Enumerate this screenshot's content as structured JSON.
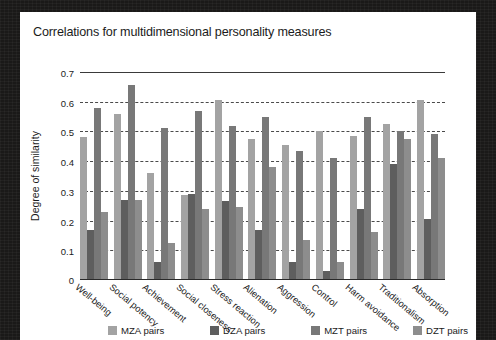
{
  "card": {
    "background": "#ffffff",
    "frame_color": "#1a1918"
  },
  "chart_data": {
    "type": "bar",
    "title": "Correlations for multidimensional personality measures",
    "xlabel": "",
    "ylabel": "Degree of similarity",
    "ylim": [
      0,
      0.7
    ],
    "yticks": [
      "0",
      "0.1",
      "0.2",
      "0.3",
      "0.4",
      "0.5",
      "0.6",
      "0.7"
    ],
    "ytick_values": [
      0,
      0.1,
      0.2,
      0.3,
      0.4,
      0.5,
      0.6,
      0.7
    ],
    "grid": true,
    "grid_style": "dashed-horizontal",
    "legend_position": "bottom",
    "categories": [
      "Well-being",
      "Social potency",
      "Achievement",
      "Social closeness",
      "Stress reaction",
      "Alienation",
      "Aggression",
      "Control",
      "Harm avoidance",
      "Traditionalism",
      "Absorption"
    ],
    "series": [
      {
        "name": "MZA pairs",
        "color": "#a3a3a3",
        "values": [
          0.48,
          0.56,
          0.36,
          0.285,
          0.605,
          0.475,
          0.455,
          0.5,
          0.485,
          0.525,
          0.605
        ]
      },
      {
        "name": "DZA pairs",
        "color": "#5e5e5e",
        "values": [
          0.17,
          0.27,
          0.06,
          0.29,
          0.265,
          0.17,
          0.06,
          0.03,
          0.24,
          0.39,
          0.205
        ]
      },
      {
        "name": "MZT pairs",
        "color": "#787878",
        "values": [
          0.58,
          0.655,
          0.51,
          0.57,
          0.52,
          0.55,
          0.435,
          0.41,
          0.55,
          0.5,
          0.49
        ]
      },
      {
        "name": "DZT pairs",
        "color": "#8d8d8d",
        "values": [
          0.23,
          0.27,
          0.125,
          0.24,
          0.245,
          0.38,
          0.135,
          0.06,
          0.16,
          0.475,
          0.41
        ]
      }
    ]
  },
  "legend": {
    "items": [
      {
        "label": "MZA pairs",
        "color": "#a3a3a3"
      },
      {
        "label": "DZA pairs",
        "color": "#5e5e5e"
      },
      {
        "label": "MZT pairs",
        "color": "#787878"
      },
      {
        "label": "DZT pairs",
        "color": "#8d8d8d"
      }
    ]
  }
}
